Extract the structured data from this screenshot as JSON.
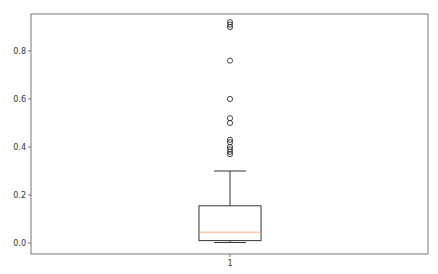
{
  "chart_data": {
    "type": "boxplot",
    "title": "",
    "xlabel": "",
    "ylabel": "",
    "categories": [
      "1"
    ],
    "ylim": [
      -0.05,
      0.95
    ],
    "yticks": [
      0.0,
      0.2,
      0.4,
      0.6,
      0.8
    ],
    "ytick_labels": [
      "0.0",
      "0.2",
      "0.4",
      "0.6",
      "0.8"
    ],
    "grid": false,
    "legend": null,
    "series": [
      {
        "name": "1",
        "whisker_low": 0.002,
        "q1": 0.01,
        "median": 0.045,
        "q3": 0.155,
        "whisker_high": 0.3,
        "outliers": [
          0.37,
          0.38,
          0.39,
          0.4,
          0.42,
          0.43,
          0.5,
          0.52,
          0.6,
          0.76,
          0.9,
          0.91,
          0.92
        ]
      }
    ],
    "colors": {
      "box": "#333333",
      "median": "#f4b183",
      "outlier": "#333333",
      "axes": "#555555"
    }
  }
}
